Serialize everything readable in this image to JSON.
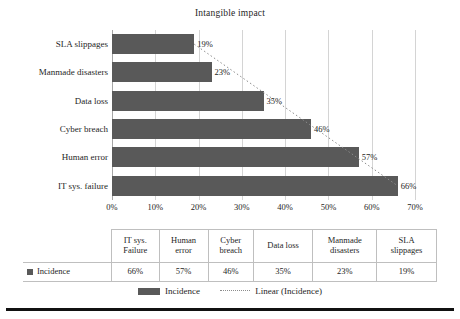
{
  "chart_data": {
    "type": "bar",
    "orientation": "horizontal",
    "title": "Intangible impact",
    "xlabel": "",
    "ylabel": "",
    "categories": [
      "SLA slippages",
      "Manmade disasters",
      "Data loss",
      "Cyber breach",
      "Human error",
      "IT sys. failure"
    ],
    "values": [
      19,
      23,
      35,
      46,
      57,
      66
    ],
    "data_labels": [
      "19%",
      "23%",
      "35%",
      "46%",
      "57%",
      "66%"
    ],
    "xlim": [
      0,
      70
    ],
    "xticks": [
      0,
      10,
      20,
      30,
      40,
      50,
      60,
      70
    ],
    "xtick_labels": [
      "0%",
      "10%",
      "20%",
      "30%",
      "40%",
      "50%",
      "60%",
      "70%"
    ],
    "grid": true,
    "legend_position": "bottom",
    "series": [
      {
        "name": "Incidence",
        "values": [
          19,
          23,
          35,
          46,
          57,
          66
        ]
      }
    ],
    "trendline": {
      "name": "Linear (Incidence)",
      "style": "dotted",
      "from_value": 19,
      "to_value": 66
    },
    "bar_color": "#595959",
    "trendline_color": "#8c8c8c",
    "gridline_color": "#d4d4d4"
  },
  "chart": {
    "title": "Intangible impact",
    "bars": [
      {
        "label": "SLA slippages",
        "value": 19,
        "data_label": "19%"
      },
      {
        "label": "Manmade disasters",
        "value": 23,
        "data_label": "23%"
      },
      {
        "label": "Data loss",
        "value": 35,
        "data_label": "35%"
      },
      {
        "label": "Cyber breach",
        "value": 46,
        "data_label": "46%"
      },
      {
        "label": "Human error",
        "value": 57,
        "data_label": "57%"
      },
      {
        "label": "IT sys. failure",
        "value": 66,
        "data_label": "66%"
      }
    ],
    "xticks": [
      "0%",
      "10%",
      "20%",
      "30%",
      "40%",
      "50%",
      "60%",
      "70%"
    ]
  },
  "table": {
    "corner_label": "",
    "headers": [
      "IT sys. Failure",
      "Human error",
      "Cyber breach",
      "Data loss",
      "Manmade disasters",
      "SLA slippages"
    ],
    "header_lines": [
      [
        "IT sys.",
        "Failure"
      ],
      [
        "Human",
        "error"
      ],
      [
        "Cyber",
        "breach"
      ],
      [
        "Data loss",
        ""
      ],
      [
        "Manmade",
        "disasters"
      ],
      [
        "SLA",
        "slippages"
      ]
    ],
    "series_label": "Incidence",
    "values": [
      "66%",
      "57%",
      "46%",
      "35%",
      "23%",
      "19%"
    ]
  },
  "legend": {
    "items": [
      {
        "label": "Incidence",
        "marker": "bar-swatch"
      },
      {
        "label": "Linear (Incidence)",
        "marker": "dotted-line"
      }
    ]
  }
}
